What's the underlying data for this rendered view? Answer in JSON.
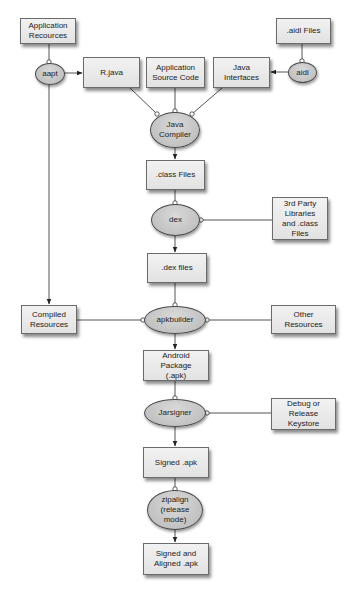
{
  "diagram": {
    "title": "",
    "colors": {
      "box_fill": "#e8e8e8",
      "box_border": "#6b6b6b",
      "ellipse_fill": "#c8c8c8",
      "ellipse_border": "#4a4a4a",
      "edge": "#555555",
      "background": "#ffffff"
    },
    "nodes": {
      "app_resources": {
        "label": "Application\nRecources",
        "shape": "box"
      },
      "aidl_files": {
        "label": ".aidl Files",
        "shape": "box"
      },
      "aapt": {
        "label": "aapt",
        "shape": "ellipse"
      },
      "r_java": {
        "label": "R.java",
        "shape": "box"
      },
      "app_source": {
        "label": "Application\nSource Code",
        "shape": "box"
      },
      "java_interfaces": {
        "label": "Java\nInterfaces",
        "shape": "box"
      },
      "aidl": {
        "label": "aidl",
        "shape": "ellipse"
      },
      "java_compiler": {
        "label": "Java\nCompiler",
        "shape": "ellipse"
      },
      "class_files": {
        "label": ".class Files",
        "shape": "box"
      },
      "dex": {
        "label": "dex",
        "shape": "ellipse"
      },
      "third_party": {
        "label": "3rd Party\nLibraries\nand .class\nFiles",
        "shape": "box"
      },
      "dex_files": {
        "label": ".dex files",
        "shape": "box"
      },
      "compiled_resources": {
        "label": "Compiled\nResources",
        "shape": "box"
      },
      "apkbuilder": {
        "label": "apkbuilder",
        "shape": "ellipse"
      },
      "other_resources": {
        "label": "Other Resources",
        "shape": "box"
      },
      "android_package": {
        "label": "Android Package\n(.apk)",
        "shape": "box"
      },
      "jarsigner": {
        "label": "Jarsigner",
        "shape": "ellipse"
      },
      "keystore": {
        "label": "Debug or\nRelease\nKeystore",
        "shape": "box"
      },
      "signed_apk": {
        "label": "Signed .apk",
        "shape": "box"
      },
      "zipalign": {
        "label": "zipalign\n(release\nmode)",
        "shape": "ellipse"
      },
      "signed_aligned": {
        "label": "Signed and\nAligned .apk",
        "shape": "box"
      }
    },
    "edges": [
      {
        "from": "app_resources",
        "to": "aapt",
        "type": "input"
      },
      {
        "from": "aapt",
        "to": "r_java",
        "type": "output"
      },
      {
        "from": "aapt",
        "to": "compiled_resources",
        "type": "output"
      },
      {
        "from": "aidl_files",
        "to": "aidl",
        "type": "input"
      },
      {
        "from": "aidl",
        "to": "java_interfaces",
        "type": "output"
      },
      {
        "from": "r_java",
        "to": "java_compiler",
        "type": "input"
      },
      {
        "from": "app_source",
        "to": "java_compiler",
        "type": "input"
      },
      {
        "from": "java_interfaces",
        "to": "java_compiler",
        "type": "input"
      },
      {
        "from": "java_compiler",
        "to": "class_files",
        "type": "output"
      },
      {
        "from": "class_files",
        "to": "dex",
        "type": "input"
      },
      {
        "from": "third_party",
        "to": "dex",
        "type": "input"
      },
      {
        "from": "dex",
        "to": "dex_files",
        "type": "output"
      },
      {
        "from": "dex_files",
        "to": "apkbuilder",
        "type": "input"
      },
      {
        "from": "compiled_resources",
        "to": "apkbuilder",
        "type": "input"
      },
      {
        "from": "other_resources",
        "to": "apkbuilder",
        "type": "input"
      },
      {
        "from": "apkbuilder",
        "to": "android_package",
        "type": "output"
      },
      {
        "from": "android_package",
        "to": "jarsigner",
        "type": "input"
      },
      {
        "from": "keystore",
        "to": "jarsigner",
        "type": "input"
      },
      {
        "from": "jarsigner",
        "to": "signed_apk",
        "type": "output"
      },
      {
        "from": "signed_apk",
        "to": "zipalign",
        "type": "input"
      },
      {
        "from": "zipalign",
        "to": "signed_aligned",
        "type": "output"
      }
    ]
  }
}
